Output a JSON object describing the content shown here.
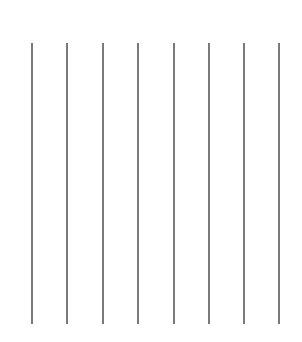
{
  "canvas": {
    "width": 302,
    "height": 342,
    "background": "#ffffff"
  },
  "lines": {
    "color": "#7a7a7a",
    "top": 43,
    "bottom": 324,
    "x_positions": [
      32,
      67,
      103,
      138,
      174,
      209,
      244,
      279
    ]
  }
}
